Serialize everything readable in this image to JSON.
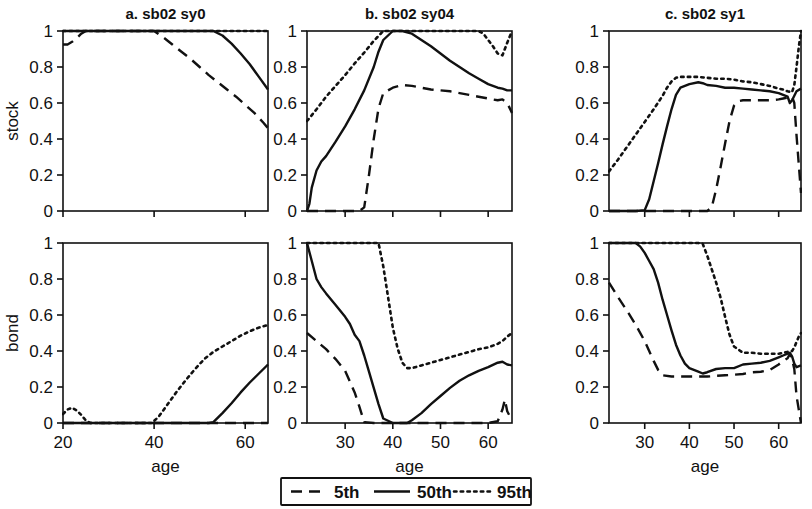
{
  "figure": {
    "background": "#ffffff",
    "ink_color": "#111111",
    "y_axis_labels": [
      "stock",
      "bond"
    ],
    "x_axis_title": "age"
  },
  "legend": {
    "position": "bottom-center",
    "entries": [
      {
        "label": "5th",
        "style": "dashed"
      },
      {
        "label": "50th",
        "style": "solid"
      },
      {
        "label": "95th",
        "style": "dotted"
      }
    ]
  },
  "chart_data": [
    {
      "type": "line",
      "title": "a. sb02 sy0",
      "panel": "a-stock",
      "xlabel": "age",
      "ylabel": "stock",
      "xlim": [
        20,
        65
      ],
      "ylim": [
        0,
        1
      ],
      "xticks": [
        20,
        40,
        60
      ],
      "yticks": [
        0,
        0.2,
        0.4,
        0.6,
        0.8,
        1
      ],
      "grid": false,
      "legend_position": "figure-bottom",
      "series": [
        {
          "name": "5th",
          "style": "dashed",
          "x": [
            20,
            21,
            22,
            23,
            24,
            25,
            30,
            35,
            40,
            42,
            44,
            46,
            48,
            50,
            52,
            54,
            56,
            58,
            60,
            62,
            64,
            65
          ],
          "y": [
            0.925,
            0.925,
            0.94,
            0.96,
            0.985,
            1.0,
            1.0,
            1.0,
            1.0,
            0.965,
            0.925,
            0.885,
            0.845,
            0.8,
            0.755,
            0.715,
            0.675,
            0.635,
            0.59,
            0.545,
            0.49,
            0.46
          ]
        },
        {
          "name": "50th",
          "style": "solid",
          "x": [
            20,
            25,
            30,
            35,
            40,
            45,
            50,
            53,
            55,
            57,
            59,
            61,
            63,
            65
          ],
          "y": [
            1.0,
            1.0,
            1.0,
            1.0,
            1.0,
            1.0,
            1.0,
            1.0,
            0.975,
            0.93,
            0.875,
            0.815,
            0.745,
            0.675
          ]
        },
        {
          "name": "95th",
          "style": "dotted",
          "x": [
            20,
            30,
            40,
            50,
            60,
            65
          ],
          "y": [
            1.0,
            1.0,
            1.0,
            1.0,
            1.0,
            1.0
          ]
        }
      ]
    },
    {
      "type": "line",
      "title": "a. sb02 sy0",
      "panel": "a-bond",
      "xlabel": "age",
      "ylabel": "bond",
      "xlim": [
        20,
        65
      ],
      "ylim": [
        0,
        1
      ],
      "xticks": [
        20,
        40,
        60
      ],
      "yticks": [
        0,
        0.2,
        0.4,
        0.6,
        0.8,
        1
      ],
      "grid": false,
      "series": [
        {
          "name": "5th",
          "style": "dashed",
          "x": [
            20,
            30,
            40,
            50,
            60,
            65
          ],
          "y": [
            0.0,
            0.0,
            0.0,
            0.0,
            0.0,
            0.0
          ]
        },
        {
          "name": "50th",
          "style": "solid",
          "x": [
            20,
            30,
            40,
            50,
            52,
            53,
            55,
            57,
            59,
            61,
            63,
            65
          ],
          "y": [
            0.0,
            0.0,
            0.0,
            0.0,
            0.0,
            0.005,
            0.055,
            0.11,
            0.17,
            0.225,
            0.275,
            0.325
          ]
        },
        {
          "name": "95th",
          "style": "dotted",
          "x": [
            20,
            21,
            22,
            23,
            24,
            25,
            26,
            30,
            35,
            39.5,
            41,
            43,
            45,
            47,
            49,
            51,
            53,
            55,
            57,
            59,
            61,
            63,
            65
          ],
          "y": [
            0.05,
            0.075,
            0.085,
            0.07,
            0.045,
            0.015,
            0.0,
            0.0,
            0.0,
            0.0,
            0.035,
            0.105,
            0.175,
            0.24,
            0.3,
            0.355,
            0.395,
            0.425,
            0.455,
            0.485,
            0.51,
            0.53,
            0.545
          ]
        }
      ]
    },
    {
      "type": "line",
      "title": "b. sb02 sy04",
      "panel": "b-stock",
      "xlabel": "age",
      "ylabel": "stock",
      "xlim": [
        22,
        65
      ],
      "ylim": [
        0,
        1
      ],
      "xticks": [
        30,
        40,
        50,
        60
      ],
      "yticks": [
        0,
        0.2,
        0.4,
        0.6,
        0.8,
        1
      ],
      "grid": false,
      "series": [
        {
          "name": "5th",
          "style": "dashed",
          "x": [
            22,
            26,
            30,
            33,
            34,
            35,
            36,
            37,
            38,
            40,
            42,
            44,
            46,
            48,
            50,
            52,
            54,
            56,
            58,
            60,
            62,
            63,
            64,
            65
          ],
          "y": [
            0.0,
            0.0,
            0.0,
            0.0,
            0.02,
            0.2,
            0.4,
            0.57,
            0.655,
            0.685,
            0.7,
            0.695,
            0.685,
            0.675,
            0.67,
            0.665,
            0.655,
            0.645,
            0.635,
            0.625,
            0.615,
            0.62,
            0.6,
            0.545
          ]
        },
        {
          "name": "50th",
          "style": "solid",
          "x": [
            22,
            22.5,
            23,
            24,
            25,
            26,
            27,
            28,
            30,
            32,
            34,
            36,
            37,
            38,
            40,
            42,
            44,
            46,
            48,
            50,
            52,
            54,
            56,
            58,
            60,
            62,
            63,
            64,
            65
          ],
          "y": [
            0.0,
            0.04,
            0.13,
            0.225,
            0.275,
            0.305,
            0.345,
            0.385,
            0.47,
            0.565,
            0.67,
            0.8,
            0.885,
            0.95,
            1.0,
            1.0,
            0.985,
            0.95,
            0.915,
            0.875,
            0.835,
            0.8,
            0.765,
            0.735,
            0.705,
            0.685,
            0.68,
            0.67,
            0.67
          ]
        },
        {
          "name": "95th",
          "style": "dotted",
          "x": [
            22,
            24,
            26,
            28,
            30,
            32,
            34,
            36,
            38,
            40,
            45,
            50,
            55,
            58,
            59,
            60,
            61,
            62,
            63,
            64,
            65
          ],
          "y": [
            0.5,
            0.565,
            0.635,
            0.695,
            0.755,
            0.82,
            0.88,
            0.945,
            1.0,
            1.0,
            1.0,
            1.0,
            1.0,
            1.0,
            0.985,
            0.95,
            0.915,
            0.875,
            0.865,
            0.935,
            1.0
          ]
        }
      ]
    },
    {
      "type": "line",
      "title": "b. sb02 sy04",
      "panel": "b-bond",
      "xlabel": "age",
      "ylabel": "bond",
      "xlim": [
        22,
        65
      ],
      "ylim": [
        0,
        1
      ],
      "xticks": [
        30,
        40,
        50,
        60
      ],
      "yticks": [
        0,
        0.2,
        0.4,
        0.6,
        0.8,
        1
      ],
      "grid": false,
      "series": [
        {
          "name": "5th",
          "style": "dashed",
          "x": [
            22,
            24,
            26,
            28,
            30,
            32,
            33,
            34,
            36,
            40,
            45,
            50,
            55,
            60,
            62,
            63,
            63.5,
            64,
            65
          ],
          "y": [
            0.5,
            0.455,
            0.41,
            0.355,
            0.29,
            0.17,
            0.09,
            0.005,
            0.0,
            0.0,
            0.0,
            0.0,
            0.0,
            0.0,
            0.01,
            0.075,
            0.13,
            0.065,
            0.015
          ]
        },
        {
          "name": "50th",
          "style": "solid",
          "x": [
            22,
            23,
            24,
            25,
            26,
            28,
            30,
            31,
            32,
            33,
            34,
            35,
            36,
            37,
            38,
            40,
            42,
            43,
            44,
            46,
            48,
            50,
            52,
            54,
            56,
            58,
            60,
            62,
            63,
            64,
            65
          ],
          "y": [
            1.0,
            0.9,
            0.8,
            0.755,
            0.72,
            0.655,
            0.59,
            0.55,
            0.49,
            0.455,
            0.375,
            0.285,
            0.195,
            0.105,
            0.025,
            0.0,
            0.0,
            0.0,
            0.015,
            0.055,
            0.105,
            0.15,
            0.195,
            0.235,
            0.265,
            0.29,
            0.31,
            0.335,
            0.34,
            0.325,
            0.32
          ]
        },
        {
          "name": "95th",
          "style": "dotted",
          "x": [
            22,
            26,
            30,
            34,
            36,
            37,
            38,
            39,
            40,
            41,
            42,
            43,
            44,
            46,
            48,
            50,
            52,
            54,
            56,
            58,
            60,
            62,
            63,
            64,
            65
          ],
          "y": [
            1.0,
            1.0,
            1.0,
            1.0,
            1.0,
            1.0,
            0.87,
            0.7,
            0.53,
            0.415,
            0.335,
            0.305,
            0.305,
            0.32,
            0.335,
            0.35,
            0.365,
            0.38,
            0.395,
            0.41,
            0.42,
            0.44,
            0.455,
            0.48,
            0.5
          ]
        }
      ]
    },
    {
      "type": "line",
      "title": "c. sb02 sy1",
      "panel": "c-stock",
      "xlabel": "age",
      "ylabel": "stock",
      "xlim": [
        22,
        65
      ],
      "ylim": [
        0,
        1
      ],
      "xticks": [
        30,
        40,
        50,
        60
      ],
      "yticks": [
        0,
        0.2,
        0.4,
        0.6,
        0.8,
        1
      ],
      "grid": false,
      "series": [
        {
          "name": "5th",
          "style": "dashed",
          "x": [
            22,
            30,
            38,
            44,
            45,
            46,
            47,
            48,
            49,
            50,
            51,
            52,
            54,
            56,
            58,
            60,
            61,
            62,
            63,
            63.5,
            64,
            65
          ],
          "y": [
            0.0,
            0.0,
            0.0,
            0.0,
            0.02,
            0.12,
            0.245,
            0.375,
            0.5,
            0.585,
            0.61,
            0.615,
            0.615,
            0.615,
            0.615,
            0.62,
            0.625,
            0.63,
            0.635,
            0.6,
            0.42,
            0.1
          ]
        },
        {
          "name": "50th",
          "style": "solid",
          "x": [
            22,
            28,
            30,
            31,
            32,
            33,
            34,
            35,
            36,
            37,
            38,
            40,
            42,
            43,
            44,
            46,
            48,
            50,
            52,
            54,
            56,
            58,
            60,
            61,
            62,
            62.5,
            63,
            63.5,
            64,
            65
          ],
          "y": [
            0.0,
            0.0,
            0.005,
            0.065,
            0.165,
            0.265,
            0.37,
            0.47,
            0.565,
            0.645,
            0.685,
            0.705,
            0.715,
            0.71,
            0.7,
            0.695,
            0.685,
            0.685,
            0.68,
            0.675,
            0.67,
            0.665,
            0.655,
            0.645,
            0.635,
            0.6,
            0.615,
            0.64,
            0.665,
            0.68
          ]
        },
        {
          "name": "95th",
          "style": "dotted",
          "x": [
            22,
            24,
            26,
            28,
            30,
            32,
            34,
            35,
            36,
            37,
            38,
            40,
            42,
            44,
            46,
            48,
            50,
            52,
            54,
            56,
            58,
            60,
            61,
            62,
            63,
            63.5,
            64,
            64.5,
            65
          ],
          "y": [
            0.22,
            0.285,
            0.355,
            0.425,
            0.495,
            0.565,
            0.64,
            0.685,
            0.72,
            0.74,
            0.745,
            0.745,
            0.745,
            0.74,
            0.735,
            0.735,
            0.73,
            0.72,
            0.715,
            0.705,
            0.695,
            0.68,
            0.675,
            0.665,
            0.66,
            0.7,
            0.8,
            0.91,
            1.0
          ]
        }
      ]
    },
    {
      "type": "line",
      "title": "c. sb02 sy1",
      "panel": "c-bond",
      "xlabel": "age",
      "ylabel": "bond",
      "xlim": [
        22,
        65
      ],
      "ylim": [
        0,
        1
      ],
      "xticks": [
        30,
        40,
        50,
        60
      ],
      "yticks": [
        0,
        0.2,
        0.4,
        0.6,
        0.8,
        1
      ],
      "grid": false,
      "series": [
        {
          "name": "5th",
          "style": "dashed",
          "x": [
            22,
            24,
            26,
            28,
            30,
            31,
            32,
            33,
            34,
            36,
            40,
            44,
            46,
            48,
            50,
            52,
            54,
            56,
            58,
            60,
            61,
            62,
            62.5,
            63,
            63.5,
            64,
            65
          ],
          "y": [
            0.78,
            0.7,
            0.625,
            0.545,
            0.455,
            0.4,
            0.345,
            0.295,
            0.265,
            0.258,
            0.258,
            0.258,
            0.262,
            0.265,
            0.268,
            0.272,
            0.282,
            0.285,
            0.295,
            0.325,
            0.345,
            0.36,
            0.385,
            0.355,
            0.3,
            0.15,
            0.0
          ]
        },
        {
          "name": "50th",
          "style": "solid",
          "x": [
            22,
            26,
            28,
            29,
            30,
            31,
            32,
            33,
            34,
            35,
            36,
            37,
            38,
            39,
            40,
            42,
            43,
            44,
            46,
            48,
            50,
            52,
            54,
            56,
            58,
            60,
            61,
            62,
            62.5,
            63,
            63.5,
            64,
            65
          ],
          "y": [
            1.0,
            1.0,
            1.0,
            0.98,
            0.945,
            0.9,
            0.855,
            0.78,
            0.685,
            0.6,
            0.515,
            0.435,
            0.375,
            0.33,
            0.305,
            0.285,
            0.275,
            0.282,
            0.3,
            0.305,
            0.305,
            0.325,
            0.33,
            0.335,
            0.345,
            0.365,
            0.375,
            0.385,
            0.39,
            0.37,
            0.33,
            0.31,
            0.32
          ]
        },
        {
          "name": "95th",
          "style": "dotted",
          "x": [
            22,
            28,
            34,
            40,
            42,
            43,
            44,
            45,
            46,
            47,
            48,
            49,
            50,
            52,
            54,
            56,
            58,
            60,
            61,
            62,
            63,
            63.5,
            64,
            64.5,
            65
          ],
          "y": [
            1.0,
            1.0,
            1.0,
            1.0,
            1.0,
            0.995,
            0.93,
            0.855,
            0.78,
            0.695,
            0.59,
            0.49,
            0.425,
            0.39,
            0.39,
            0.385,
            0.385,
            0.385,
            0.39,
            0.395,
            0.4,
            0.42,
            0.45,
            0.48,
            0.5
          ]
        }
      ]
    }
  ]
}
